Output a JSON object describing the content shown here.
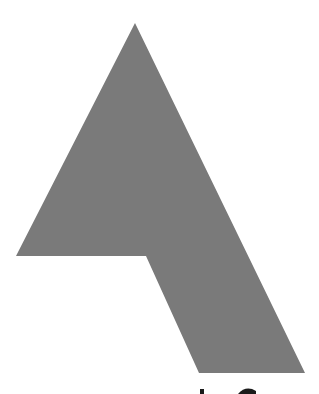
{
  "graphic": {
    "description": "Large gray stylized A/arrow-shaped logo mark",
    "fill_color": "#7a7a7a",
    "background_color": "#ffffff",
    "shape_points": "135,23 16,256 146,256 199,373 305,373",
    "partial_glyphs_color": "#1a1a1a"
  }
}
